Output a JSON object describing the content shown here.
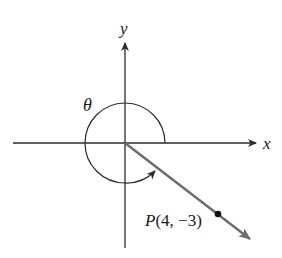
{
  "diagram": {
    "type": "angle-in-standard-position",
    "axes": {
      "x_label": "x",
      "y_label": "y"
    },
    "angle": {
      "label": "θ",
      "direction": "counterclockwise",
      "description": "angle from positive x-axis to terminal ray through P, drawn as nearly a full rotation"
    },
    "point": {
      "name": "P",
      "coords_text": "(4, −3)",
      "x": 4,
      "y": -3
    },
    "colors": {
      "axes": "#2a2a2a",
      "ray": "#6b6b6b",
      "point": "#111111",
      "text": "#1a1a1a"
    }
  }
}
